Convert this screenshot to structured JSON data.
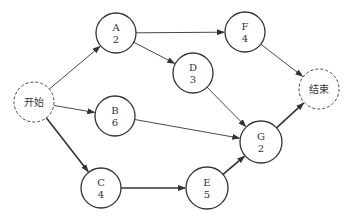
{
  "diagram": {
    "type": "activity-on-node network",
    "colors": {
      "stroke": "#333333",
      "text": "#333333",
      "background": "#ffffff"
    },
    "nodes": [
      {
        "id": "start",
        "label": "开始",
        "duration": "",
        "x": 34,
        "y": 102,
        "r": 20,
        "dashed": true
      },
      {
        "id": "A",
        "label": "A",
        "duration": "2",
        "x": 116,
        "y": 33,
        "r": 20,
        "dashed": false
      },
      {
        "id": "F",
        "label": "F",
        "duration": "4",
        "x": 245,
        "y": 32,
        "r": 20,
        "dashed": false
      },
      {
        "id": "D",
        "label": "D",
        "duration": "3",
        "x": 193,
        "y": 73,
        "r": 20,
        "dashed": false
      },
      {
        "id": "end",
        "label": "结束",
        "duration": "",
        "x": 319,
        "y": 89,
        "r": 20,
        "dashed": true
      },
      {
        "id": "B",
        "label": "B",
        "duration": "6",
        "x": 115,
        "y": 116,
        "r": 20,
        "dashed": false
      },
      {
        "id": "G",
        "label": "G",
        "duration": "2",
        "x": 261,
        "y": 142,
        "r": 21,
        "dashed": false
      },
      {
        "id": "C",
        "label": "C",
        "duration": "4",
        "x": 101,
        "y": 188,
        "r": 20,
        "dashed": false
      },
      {
        "id": "E",
        "label": "E",
        "duration": "5",
        "x": 207,
        "y": 188,
        "r": 21,
        "dashed": false
      }
    ],
    "edges": [
      {
        "from": "start",
        "to": "A",
        "bold": false
      },
      {
        "from": "start",
        "to": "B",
        "bold": false
      },
      {
        "from": "start",
        "to": "C",
        "bold": true
      },
      {
        "from": "A",
        "to": "F",
        "bold": false
      },
      {
        "from": "A",
        "to": "D",
        "bold": false
      },
      {
        "from": "F",
        "to": "end",
        "bold": false
      },
      {
        "from": "D",
        "to": "G",
        "bold": false
      },
      {
        "from": "B",
        "to": "G",
        "bold": false
      },
      {
        "from": "C",
        "to": "E",
        "bold": true
      },
      {
        "from": "E",
        "to": "G",
        "bold": true
      },
      {
        "from": "G",
        "to": "end",
        "bold": true
      }
    ]
  }
}
